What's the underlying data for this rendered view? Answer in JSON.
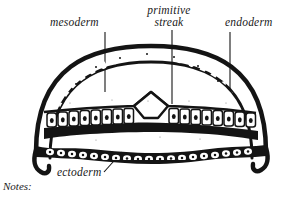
{
  "figure": {
    "background_color": "#ffffff",
    "ink_color": "#111111",
    "labels": {
      "mesoderm": "mesoderm",
      "primitive_streak_line1": "primitive",
      "primitive_streak_line2": "streak",
      "endoderm": "endoderm",
      "ectoderm": "ectoderm"
    },
    "notes_caption": "Notes:"
  }
}
